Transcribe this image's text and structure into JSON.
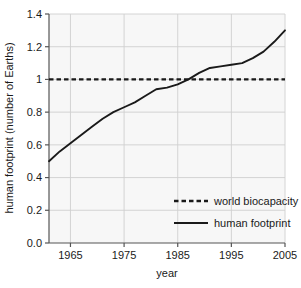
{
  "chart_data": {
    "type": "line",
    "title": "",
    "xlabel": "year",
    "ylabel": "human footprint (number of Earths)",
    "xlim": [
      1961,
      2005
    ],
    "ylim": [
      0.0,
      1.4
    ],
    "grid": true,
    "legend_position": "lower right",
    "xticks": [
      1965,
      1975,
      1985,
      1995,
      2005
    ],
    "xtick_labels": [
      "1965",
      "1975",
      "1985",
      "1995",
      "2005"
    ],
    "yticks": [
      0.0,
      0.2,
      0.4,
      0.6,
      0.8,
      1.0,
      1.2,
      1.4
    ],
    "ytick_labels": [
      "0.0",
      "0.2",
      "0.4",
      "0.6",
      "0.8",
      "1",
      "1.2",
      "1.4"
    ],
    "series": [
      {
        "name": "world biocapacity",
        "style": "dashed",
        "color": "#1a1a1a",
        "x": [
          1961,
          2005
        ],
        "values": [
          1.0,
          1.0
        ]
      },
      {
        "name": "human footprint",
        "style": "solid",
        "color": "#1a1a1a",
        "x": [
          1961,
          1963,
          1965,
          1967,
          1969,
          1971,
          1973,
          1975,
          1977,
          1979,
          1981,
          1983,
          1985,
          1987,
          1989,
          1991,
          1993,
          1995,
          1997,
          1999,
          2001,
          2003,
          2005
        ],
        "values": [
          0.5,
          0.56,
          0.61,
          0.66,
          0.71,
          0.76,
          0.8,
          0.83,
          0.86,
          0.9,
          0.94,
          0.95,
          0.97,
          1.0,
          1.04,
          1.07,
          1.08,
          1.09,
          1.1,
          1.13,
          1.17,
          1.23,
          1.3
        ]
      }
    ]
  },
  "legend": {
    "items": [
      {
        "label": "world biocapacity",
        "style": "dashed"
      },
      {
        "label": "human footprint",
        "style": "solid"
      }
    ]
  },
  "colors": {
    "plot_background": "#f7f7f7",
    "grid": "#cfcfcf",
    "axis": "#555555",
    "line": "#1a1a1a",
    "text": "#1a1a1a"
  }
}
